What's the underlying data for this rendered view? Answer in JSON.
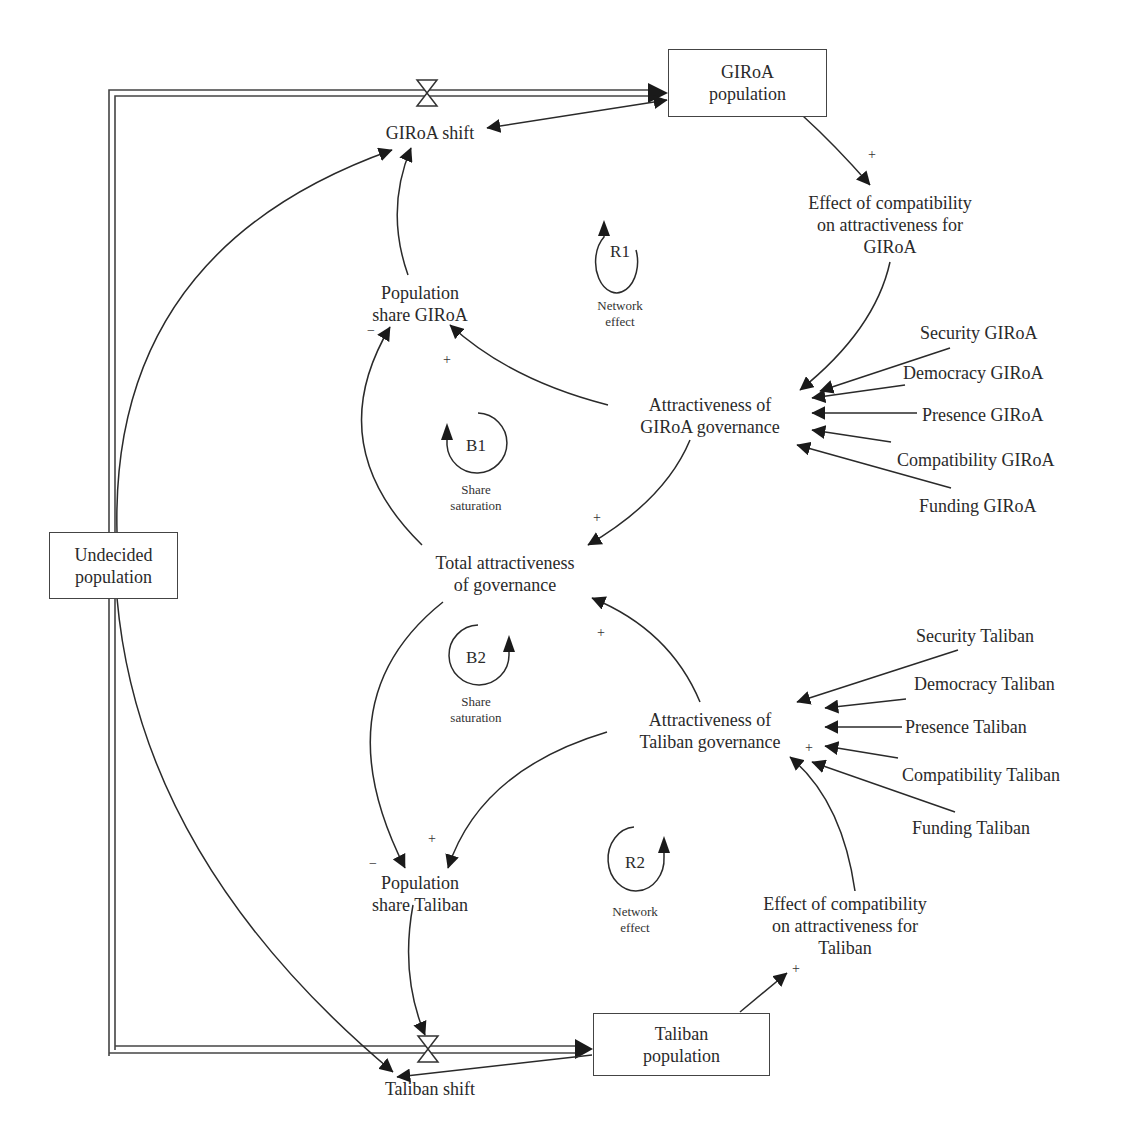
{
  "stocks": {
    "giroa_population": "GIRoA\npopulation",
    "undecided_population": "Undecided\npopulation",
    "taliban_population": "Taliban\npopulation"
  },
  "flows": {
    "giroa_shift": "GIRoA shift",
    "taliban_shift": "Taliban shift"
  },
  "variables": {
    "effect_giroa": "Effect of compatibility\non attractiveness for\nGIRoA",
    "pop_share_giroa": "Population\nshare GIRoA",
    "attr_giroa": "Attractiveness of\nGIRoA governance",
    "total_attr": "Total attractiveness\nof governance",
    "attr_taliban": "Attractiveness of\nTaliban governance",
    "pop_share_taliban": "Population\nshare Taliban",
    "effect_taliban": "Effect of compatibility\non attractiveness for\nTaliban"
  },
  "giroa_inputs": [
    "Security GIRoA",
    "Democracy GIRoA",
    "Presence GIRoA",
    "Compatibility GIRoA",
    "Funding GIRoA"
  ],
  "taliban_inputs": [
    "Security Taliban",
    "Democracy Taliban",
    "Presence Taliban",
    "Compatibility Taliban",
    "Funding Taliban"
  ],
  "loops": [
    {
      "id": "R1",
      "name": "Network\neffect"
    },
    {
      "id": "B1",
      "name": "Share\nsaturation"
    },
    {
      "id": "B2",
      "name": "Share\nsaturation"
    },
    {
      "id": "R2",
      "name": "Network\neffect"
    }
  ],
  "polarities": {
    "giroa_pop_to_effect": "+",
    "total_to_share_giroa": "−",
    "attr_to_share_giroa": "+",
    "attr_giroa_to_total": "+",
    "attr_taliban_to_total": "+",
    "total_to_share_taliban": "−",
    "attr_to_share_taliban": "+",
    "effect_to_attr_taliban": "+",
    "taliban_pop_to_effect": "+"
  }
}
